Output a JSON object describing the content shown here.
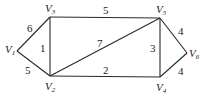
{
  "graph": {
    "vertices": [
      {
        "id": "V1",
        "name": "V",
        "sub": "1",
        "x": 17,
        "y": 51
      },
      {
        "id": "V2",
        "name": "V",
        "sub": "2",
        "x": 50,
        "y": 76
      },
      {
        "id": "V3",
        "name": "V",
        "sub": "3",
        "x": 50,
        "y": 17
      },
      {
        "id": "V4",
        "name": "V",
        "sub": "4",
        "x": 160,
        "y": 77
      },
      {
        "id": "V5",
        "name": "V",
        "sub": "5",
        "x": 160,
        "y": 18
      },
      {
        "id": "V6",
        "name": "V",
        "sub": "6",
        "x": 187,
        "y": 53
      }
    ],
    "edges": [
      {
        "from": "V1",
        "to": "V3",
        "weight": "6"
      },
      {
        "from": "V1",
        "to": "V2",
        "weight": "5"
      },
      {
        "from": "V3",
        "to": "V2",
        "weight": "1"
      },
      {
        "from": "V3",
        "to": "V5",
        "weight": "5"
      },
      {
        "from": "V2",
        "to": "V5",
        "weight": "7"
      },
      {
        "from": "V2",
        "to": "V4",
        "weight": "2"
      },
      {
        "from": "V5",
        "to": "V4",
        "weight": "3"
      },
      {
        "from": "V5",
        "to": "V6",
        "weight": "4"
      },
      {
        "from": "V4",
        "to": "V6",
        "weight": "4"
      }
    ]
  }
}
